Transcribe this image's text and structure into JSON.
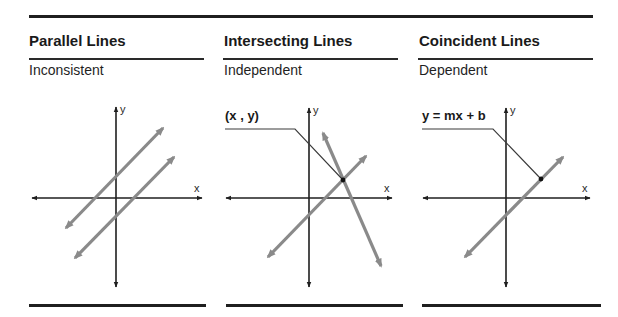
{
  "panels": [
    {
      "id": "parallel",
      "title": "Parallel Lines",
      "subtitle": "Inconsistent",
      "title_x": 29,
      "rule": [
        29,
        204
      ],
      "bottom_rule": [
        29,
        206
      ],
      "axes": {
        "x_left": 32,
        "x_right": 202,
        "y_axis_x": 116,
        "y_top": 107,
        "y_bottom": 287,
        "x_axis_y": 198
      },
      "lines": [
        {
          "x1": 66,
          "y1": 228,
          "x2": 163,
          "y2": 128
        },
        {
          "x1": 75,
          "y1": 258,
          "x2": 174,
          "y2": 157
        }
      ],
      "callout": null
    },
    {
      "id": "intersecting",
      "title": "Intersecting Lines",
      "subtitle": "Independent",
      "title_x": 224,
      "rule": [
        223,
        398
      ],
      "bottom_rule": [
        226,
        403
      ],
      "axes": {
        "x_left": 226,
        "x_right": 392,
        "y_axis_x": 309,
        "y_top": 108,
        "y_bottom": 287,
        "x_axis_y": 198
      },
      "lines": [
        {
          "x1": 268,
          "y1": 257,
          "x2": 366,
          "y2": 156
        },
        {
          "x1": 323,
          "y1": 133,
          "x2": 381,
          "y2": 266
        }
      ],
      "callout": {
        "label": "(x , y)",
        "label_x": 225,
        "label_y": 120,
        "line_start_x": 225,
        "line_y": 129,
        "bend_x": 295,
        "point_x": 343,
        "point_y": 180
      }
    },
    {
      "id": "coincident",
      "title": "Coincident Lines",
      "subtitle": "Dependent",
      "title_x": 419,
      "rule": [
        418,
        593
      ],
      "bottom_rule": [
        422,
        601
      ],
      "axes": {
        "x_left": 423,
        "x_right": 590,
        "y_axis_x": 506,
        "y_top": 108,
        "y_bottom": 287,
        "x_axis_y": 198
      },
      "lines": [
        {
          "x1": 465,
          "y1": 257,
          "x2": 563,
          "y2": 157
        }
      ],
      "callout": {
        "label": "y = mx + b",
        "label_x": 422,
        "label_y": 120,
        "line_start_x": 422,
        "line_y": 129,
        "bend_x": 493,
        "point_x": 541,
        "point_y": 179
      }
    }
  ],
  "axis_labels": {
    "x": "x",
    "y": "y"
  },
  "colors": {
    "axis": "#1f1f1f",
    "graph_line": "#8a8a8a",
    "callout_line": "#3a3a3a",
    "point": "#111111"
  }
}
